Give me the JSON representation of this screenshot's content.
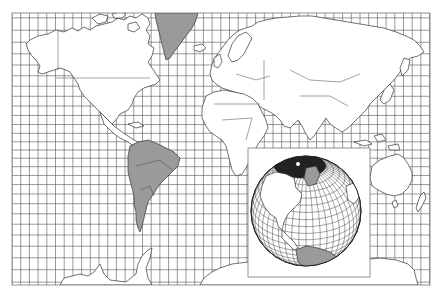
{
  "figure": {
    "title": "Mercator projection world map with orthographic globe inset",
    "projection_main": "Mercator",
    "projection_inset": "Orthographic"
  },
  "map": {
    "frame": {
      "x": 12,
      "y": 13,
      "width": 418,
      "height": 272
    },
    "grid": {
      "spacing_x": 8.7,
      "color": "#555555"
    },
    "colors": {
      "background": "#ffffff",
      "land": "#ffffff",
      "highlight_land": "#9a9a9a",
      "outline": "#333333"
    },
    "highlighted_regions": [
      "South America",
      "Greenland"
    ],
    "regions": [
      "North America",
      "Greenland",
      "South America",
      "Europe",
      "Africa",
      "Asia",
      "Australia",
      "New Zealand",
      "Antarctica"
    ]
  },
  "inset": {
    "box": {
      "x": 248,
      "y": 148,
      "width": 122,
      "height": 129
    },
    "globe": {
      "cx": 306,
      "cy": 211,
      "r": 55
    },
    "highlighted_regions": [
      "South America"
    ],
    "visible_regions": [
      "North America",
      "Greenland",
      "Arctic",
      "South America"
    ]
  }
}
